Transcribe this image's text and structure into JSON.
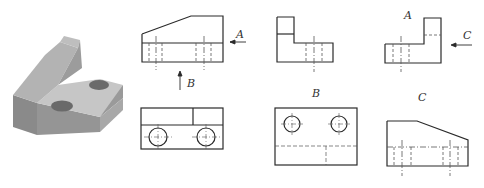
{
  "figure": {
    "colors": {
      "line": "#2a2a2a",
      "hidden": "#555555",
      "solid_top": "#b9b9b9",
      "solid_front": "#8e8e8e",
      "solid_side": "#9f9f9f"
    }
  },
  "views": {
    "front": {
      "name": "front-view"
    },
    "left": {
      "name": "left-view"
    },
    "right": {
      "name": "right-view",
      "label": "A"
    },
    "top": {
      "name": "top-view"
    },
    "bottom": {
      "name": "bottom-view",
      "label": "B"
    },
    "rear": {
      "name": "rear-view",
      "label": "C"
    }
  },
  "arrows": {
    "a": {
      "label": "A",
      "direction": "left"
    },
    "b": {
      "label": "B",
      "direction": "up"
    },
    "c": {
      "label": "C",
      "direction": "left"
    }
  }
}
